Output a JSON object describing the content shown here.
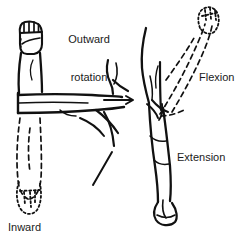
{
  "figure": {
    "background_color": "#ffffff",
    "ink_color": "#111111",
    "text_color": "#1a1a1a"
  },
  "labels": {
    "outward_rotation": {
      "line1": "Outward",
      "line2": "rotation"
    },
    "inward_rotation": {
      "line1": "Inward",
      "line2": "rotation"
    },
    "flexion": "Flexion",
    "extension": "Extension"
  },
  "panels": [
    {
      "name": "rotation-panel",
      "movements": [
        "Outward rotation",
        "Inward rotation"
      ],
      "solid_pose": "forearm raised, fist up, elbow flexed 90 degrees",
      "dashed_pose": "forearm rotated downward, fist dotted"
    },
    {
      "name": "flexion-extension-panel",
      "movements": [
        "Flexion",
        "Extension"
      ],
      "solid_pose": "arm hanging down at side, extension",
      "dashed_pose": "arm raised forward and up, flexion, dotted hand"
    }
  ]
}
